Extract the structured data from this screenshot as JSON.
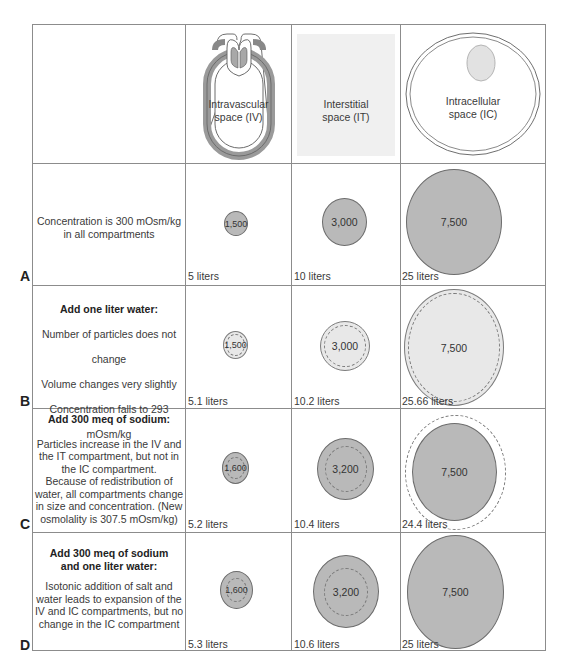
{
  "header": {
    "columns": [
      {
        "label_line1": "Intravascular",
        "label_line2": "space (IV)",
        "icon": "blood-vessel-heart-loop"
      },
      {
        "label_line1": "Interstitial",
        "label_line2": "space (IT)",
        "icon": "shaded-square"
      },
      {
        "label_line1": "Intracellular",
        "label_line2": "space (IC)",
        "icon": "cell-with-nucleus"
      }
    ]
  },
  "rows": [
    {
      "label": "A",
      "title": "",
      "lines": [
        "Concentration is 300 mOsm/kg",
        "in all compartments"
      ],
      "cells": [
        {
          "value": "1,500",
          "volume": "5 liters"
        },
        {
          "value": "3,000",
          "volume": "10 liters"
        },
        {
          "value": "7,500",
          "volume": "25 liters"
        }
      ]
    },
    {
      "label": "B",
      "title": "Add one liter water:",
      "lines": [
        "Number of particles does not change",
        "Volume changes very slightly",
        "Concentration falls to 293 mOsm/kg"
      ],
      "cells": [
        {
          "value": "1,500",
          "volume": "5.1 liters"
        },
        {
          "value": "3,000",
          "volume": "10.2 liters"
        },
        {
          "value": "7,500",
          "volume": "25.66 liters"
        }
      ]
    },
    {
      "label": "C",
      "title": "Add 300 meq of sodium:",
      "lines": [
        "Particles increase in the IV and",
        "the IT compartment, but not in",
        "the IC compartment.",
        "Because of redistribution of",
        "water, all compartments change",
        "in size and concentration. (New",
        "osmolality is 307.5 mOsm/kg)"
      ],
      "cells": [
        {
          "value": "1,600",
          "volume": "5.2 liters"
        },
        {
          "value": "3,200",
          "volume": "10.4 liters"
        },
        {
          "value": "7,500",
          "volume": "24.4 liters"
        }
      ]
    },
    {
      "label": "D",
      "title_line1": "Add 300 meq of sodium",
      "title_line2": "and one liter water:",
      "lines": [
        "Isotonic addition of salt and",
        "water leads to expansion of the",
        "IV and IC compartments, but no",
        "change in the IC compartment"
      ],
      "cells": [
        {
          "value": "1,600",
          "volume": "5.3 liters"
        },
        {
          "value": "3,200",
          "volume": "10.6 liters"
        },
        {
          "value": "7,500",
          "volume": "25 liters"
        }
      ]
    }
  ]
}
